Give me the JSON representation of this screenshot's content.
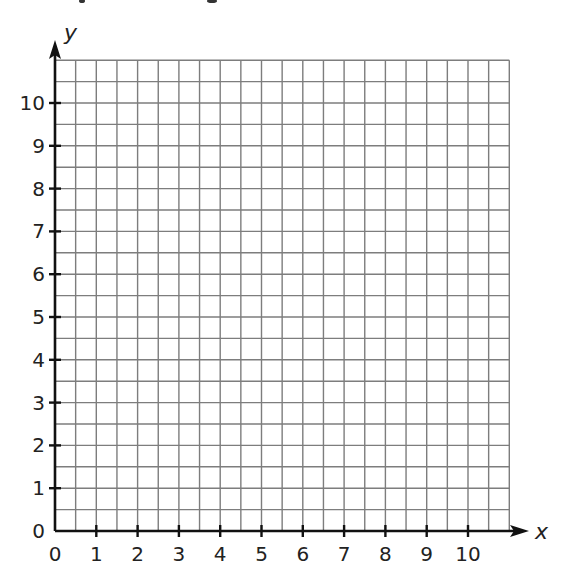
{
  "chart_data": {
    "type": "scatter",
    "title": "",
    "xlabel": "x",
    "ylabel": "y",
    "xlim": [
      0,
      11
    ],
    "ylim": [
      0,
      11
    ],
    "x_ticks": [
      "0",
      "1",
      "2",
      "3",
      "4",
      "5",
      "6",
      "7",
      "8",
      "9",
      "10"
    ],
    "y_ticks": [
      "0",
      "1",
      "2",
      "3",
      "4",
      "5",
      "6",
      "7",
      "8",
      "9",
      "10"
    ],
    "grid": true,
    "grid_step": 0.5,
    "series": [],
    "legend": null
  },
  "style": {
    "grid_color": "#7d7d7d",
    "axis_color": "#111111",
    "label_color": "#222222"
  },
  "layout": {
    "origin_x": 55,
    "origin_y": 531,
    "unit_x": 41.3,
    "unit_y": 42.8
  }
}
